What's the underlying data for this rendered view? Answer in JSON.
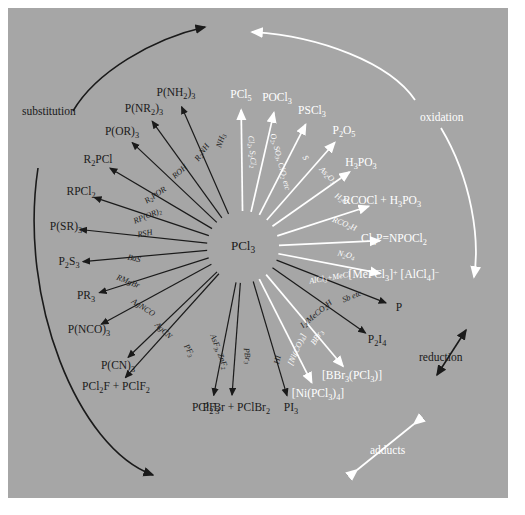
{
  "diagram": {
    "center_species": "PCl<sub>3</sub>",
    "background_color": "#a6a6a6",
    "black_ink": "#1a1a1a",
    "white_ink": "#ffffff",
    "mode_labels": [
      {
        "name": "substitution",
        "text": "substitution",
        "color": "black",
        "x": 22,
        "y": 106
      },
      {
        "name": "oxidation",
        "text": "oxidation",
        "color": "white",
        "x": 420,
        "y": 112
      },
      {
        "name": "reduction",
        "text": "reduction",
        "color": "black",
        "x": 419,
        "y": 352
      },
      {
        "name": "adducts",
        "text": "adducts",
        "color": "white",
        "x": 370,
        "y": 445
      }
    ],
    "reactions": [
      {
        "id": "pnh2",
        "ink": "black",
        "reagent": "NH<sub>3</sub>",
        "product": "P(NH<sub>2</sub>)<sub>3</sub>",
        "px": 176,
        "py": 94,
        "rx": 222,
        "ry": 141,
        "rrot": -72
      },
      {
        "id": "pnr2",
        "ink": "black",
        "reagent": "R<sub>2</sub>NH",
        "product": "P(NR<sub>2</sub>)<sub>3</sub>",
        "px": 144,
        "py": 110,
        "rx": 203,
        "ry": 153,
        "rrot": -55
      },
      {
        "id": "por",
        "ink": "black",
        "reagent": "ROH",
        "product": "P(OR)<sub>3</sub>",
        "px": 122,
        "py": 133,
        "rx": 180,
        "ry": 172,
        "rrot": -42
      },
      {
        "id": "r2pcl",
        "ink": "black",
        "reagent": "R<sub>2</sub>POR",
        "product": "R<sub>2</sub>PCl",
        "px": 98,
        "py": 161,
        "rx": 156,
        "ry": 196,
        "rrot": -34
      },
      {
        "id": "rpcl2",
        "ink": "black",
        "reagent": "RP(OR)<sub>2</sub>",
        "product": "RPCl<sub>2</sub>",
        "px": 81,
        "py": 193,
        "rx": 148,
        "ry": 217,
        "rrot": -22
      },
      {
        "id": "psr3",
        "ink": "black",
        "reagent": "RSH",
        "product": "P(SR)<sub>3</sub>",
        "px": 66,
        "py": 228,
        "rx": 145,
        "ry": 234,
        "rrot": -10
      },
      {
        "id": "p2s3",
        "ink": "black",
        "reagent": "BaS",
        "product": "P<sub>2</sub>S<sub>3</sub>",
        "px": 69,
        "py": 263,
        "rx": 134,
        "ry": 259,
        "rrot": 12
      },
      {
        "id": "pr3",
        "ink": "black",
        "reagent": "RMgBr",
        "product": "PR<sub>3</sub>",
        "px": 86,
        "py": 297,
        "rx": 128,
        "ry": 282,
        "rrot": 22
      },
      {
        "id": "pnco",
        "ink": "black",
        "reagent": "AgNCO",
        "product": "P(NCO)<sub>3</sub>",
        "px": 89,
        "py": 331,
        "rx": 143,
        "ry": 308,
        "rrot": 33
      },
      {
        "id": "pcn",
        "ink": "black",
        "reagent": "AgCN",
        "product": "P(CN)<sub>3</sub>",
        "px": 118,
        "py": 367,
        "rx": 163,
        "ry": 331,
        "rrot": 43
      },
      {
        "id": "pclf",
        "ink": "black",
        "reagent": "PF<sub>3</sub>",
        "product": "PCl<sub>2</sub>F + PClF<sub>2</sub>",
        "px": 116,
        "py": 388,
        "rx": 188,
        "ry": 351,
        "rrot": 60
      },
      {
        "id": "pf3",
        "ink": "black",
        "reagent": "AsF<sub>3</sub>, ZnF<sub>2</sub>",
        "product": "PF<sub>3</sub>",
        "px": 211,
        "py": 409,
        "rx": 218,
        "ry": 352,
        "rrot": 69
      },
      {
        "id": "pbr",
        "ink": "black",
        "reagent": "PBr<sub>3</sub>",
        "product": "PCl<sub>2</sub>Br + PClBr<sub>2</sub>",
        "px": 231,
        "py": 409,
        "rx": 246,
        "ry": 356,
        "rrot": 83
      },
      {
        "id": "pi3",
        "ink": "black",
        "reagent": "HI",
        "product": "PI<sub>3</sub>",
        "px": 291,
        "py": 409,
        "rx": 278,
        "ry": 360,
        "rrot": -78
      },
      {
        "id": "nipcl3",
        "ink": "white",
        "reagent": "[Ni(CO)<sub>4</sub>]",
        "product": "[Ni(PCl<sub>3</sub>)<sub>4</sub>]",
        "px": 318,
        "py": 395,
        "rx": 298,
        "ry": 350,
        "rrot": -66
      },
      {
        "id": "bbr3",
        "ink": "white",
        "reagent": "BBr<sub>3</sub>",
        "product": "[BBr<sub>3</sub>(PCl<sub>3</sub>)]",
        "px": 352,
        "py": 377,
        "rx": 318,
        "ry": 338,
        "rrot": -57
      },
      {
        "id": "p2i4",
        "ink": "black",
        "reagent": "I<sub>2</sub>/MeCO<sub>2</sub>H",
        "product": "P<sub>2</sub>I<sub>4</sub>",
        "px": 377,
        "py": 341,
        "rx": 317,
        "ry": 315,
        "rrot": -40
      },
      {
        "id": "p",
        "ink": "black",
        "reagent": "Sb etc",
        "product": "P",
        "px": 399,
        "py": 308,
        "rx": 352,
        "ry": 297,
        "rrot": -22
      },
      {
        "id": "mepcl3",
        "ink": "white",
        "reagent": "AlCl<sub>3</sub>+MeCl",
        "product": "[MePCl<sub>3</sub>]<sup>+</sup> [AlCl<sub>4</sub>]<sup>&minus;</sup>",
        "px": 394,
        "py": 276,
        "rx": 330,
        "ry": 279,
        "rrot": -10
      },
      {
        "id": "npocl2",
        "ink": "white",
        "reagent": "N<sub>2</sub>O<sub>4</sub>",
        "product": "Cl<sub>3</sub>P=NPOCl<sub>2</sub>",
        "px": 394,
        "py": 240,
        "rx": 346,
        "ry": 256,
        "rrot": 12
      },
      {
        "id": "rcocl",
        "ink": "white",
        "reagent": "RCO<sub>2</sub>H",
        "product": "RCOCl + H<sub>3</sub>PO<sub>3</sub>",
        "px": 382,
        "py": 202,
        "rx": 344,
        "ry": 225,
        "rrot": 22
      },
      {
        "id": "h3po3",
        "ink": "white",
        "reagent": "H<sub>2</sub>O",
        "product": "H<sub>3</sub>PO<sub>3</sub>",
        "px": 361,
        "py": 164,
        "rx": 341,
        "ry": 200,
        "rrot": 33
      },
      {
        "id": "p2o5",
        "ink": "white",
        "reagent": "As<sub>2</sub>O<sub>3</sub>",
        "product": "P<sub>2</sub>O<sub>5</sub>",
        "px": 344,
        "py": 132,
        "rx": 327,
        "ry": 176,
        "rrot": 45
      },
      {
        "id": "pscl3",
        "ink": "white",
        "reagent": "S",
        "product": "PSCl<sub>3</sub>",
        "px": 312,
        "py": 112,
        "rx": 305,
        "ry": 158,
        "rrot": 60
      },
      {
        "id": "pocl3",
        "ink": "white",
        "reagent": "O<sub>2</sub>, SO<sub>3</sub>, ClO<sub>2</sub> etc",
        "product": "POCl<sub>3</sub>",
        "px": 277,
        "py": 99,
        "rx": 279,
        "ry": 162,
        "rrot": 75
      },
      {
        "id": "pcl5",
        "ink": "white",
        "reagent": "Cl<sub>2</sub>, S<sub>2</sub>Cl<sub>2</sub>",
        "product": "PCl<sub>5</sub>",
        "px": 241,
        "py": 96,
        "rx": 251,
        "ry": 152,
        "rrot": 85
      }
    ]
  }
}
